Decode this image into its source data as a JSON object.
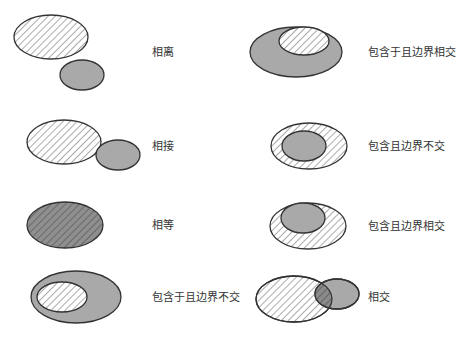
{
  "colors": {
    "gray_fill": "#a9a9a9",
    "stroke": "#333333",
    "hatch_line": "#555555",
    "hatch_bg": "#ffffff",
    "equal_fill": "#8f8f8f"
  },
  "relations": [
    {
      "id": "disjoint",
      "label": "相离",
      "description": "hatched region and gray region do not touch"
    },
    {
      "id": "tangent",
      "label": "相接",
      "description": "hatched region and gray region touch at boundary"
    },
    {
      "id": "equal",
      "label": "相等",
      "description": "hatched region and gray region coincide"
    },
    {
      "id": "contained-in-no-touch",
      "label": "包含于且边界不交",
      "description": "hatched region inside gray region, boundaries do not meet"
    },
    {
      "id": "contained-in-touch",
      "label": "包含于且边界相交",
      "description": "hatched region inside gray region, boundaries meet"
    },
    {
      "id": "contains-no-touch",
      "label": "包含且边界不交",
      "description": "hatched region contains gray region, boundaries do not meet"
    },
    {
      "id": "contains-touch",
      "label": "包含且边界相交",
      "description": "hatched region contains gray region, boundaries meet"
    },
    {
      "id": "overlap",
      "label": "相交",
      "description": "hatched region and gray region partially overlap"
    }
  ]
}
